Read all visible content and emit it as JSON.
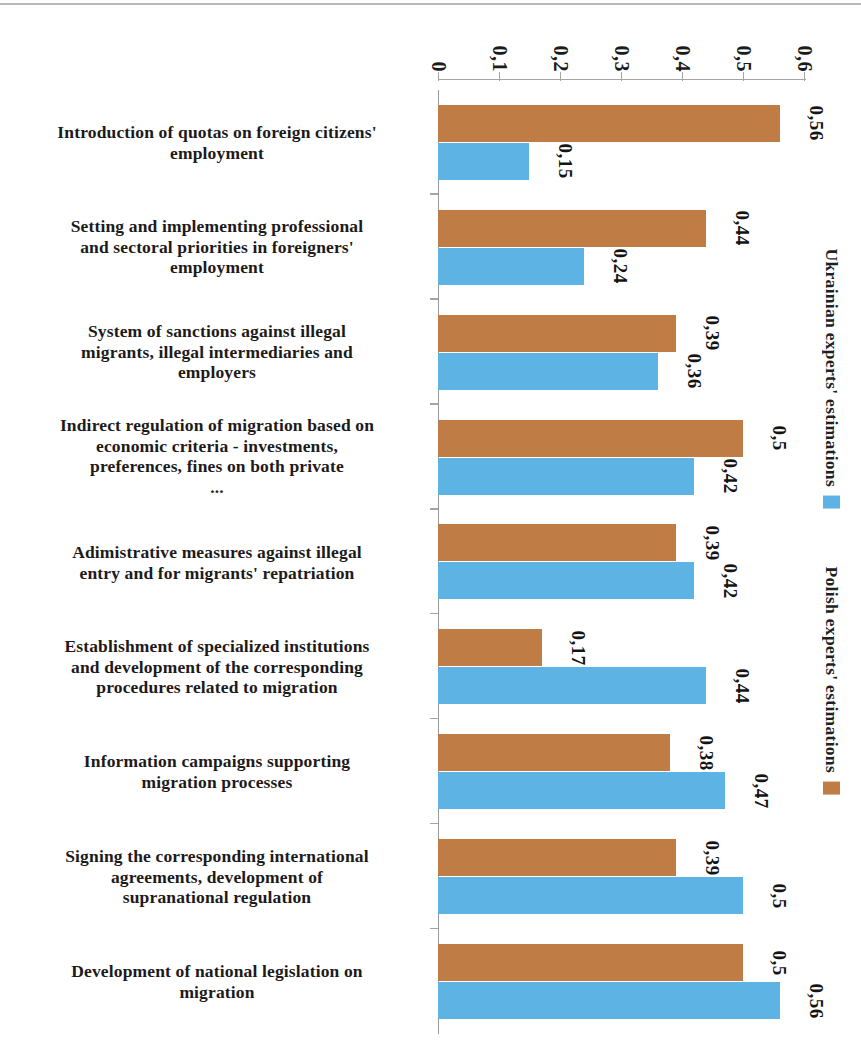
{
  "chart_data": {
    "type": "bar",
    "orientation": "horizontal",
    "title": "",
    "subtitle": "",
    "xlabel": "",
    "ylabel": "",
    "xlim": [
      0,
      0.6
    ],
    "grid": false,
    "legend_position": "left",
    "decimal_separator": ",",
    "axis_ticks": [
      "0",
      "0,1",
      "0,2",
      "0,3",
      "0,4",
      "0,5",
      "0,6"
    ],
    "axis_tick_values": [
      0,
      0.1,
      0.2,
      0.3,
      0.4,
      0.5,
      0.6
    ],
    "categories": [
      "Development of national legislation on migration",
      "Signing the corresponding international agreements, development of supranational regulation",
      "Information campaigns supporting migration processes",
      "Establishment of specialized institutions and development of the corresponding procedures related to migration",
      "Adimistrative measures against illegal entry and for migrants' repatriation",
      "Indirect regulation of migration based on economic criteria - investments, preferences, fines on both private ...",
      "System of sanctions against illegal migrants, illegal intermediaries and employers",
      "Setting and implementing professional and sectoral priorities in foreigners' employment",
      "Introduction of quotas on foreign citizens' employment"
    ],
    "category_lines": [
      [
        "Development of national legislation on",
        "migration"
      ],
      [
        "Signing the corresponding international",
        "agreements, development of",
        "supranational regulation"
      ],
      [
        "Information campaigns supporting",
        "migration processes"
      ],
      [
        "Establishment of specialized institutions",
        "and development of the corresponding",
        "procedures related to migration"
      ],
      [
        "Adimistrative measures against illegal",
        "entry and for migrants' repatriation"
      ],
      [
        "Indirect regulation of migration based on",
        "economic criteria - investments,",
        "preferences, fines on both private",
        "..."
      ],
      [
        "System of sanctions against illegal",
        "migrants, illegal intermediaries and",
        "employers"
      ],
      [
        "Setting and implementing professional",
        "and sectoral priorities in foreigners'",
        "employment"
      ],
      [
        "Introduction of quotas on foreign citizens'",
        "employment"
      ]
    ],
    "series": [
      {
        "name": "Ukrainian experts' estimations",
        "color": "#5cb3e4",
        "values": [
          0.56,
          0.5,
          0.47,
          0.44,
          0.42,
          0.42,
          0.36,
          0.24,
          0.15
        ],
        "labels": [
          "0,56",
          "0,5",
          "0,47",
          "0,44",
          "0,42",
          "0,42",
          "0,36",
          "0,24",
          "0,15"
        ]
      },
      {
        "name": "Polish experts' estimations",
        "color": "#c07c45",
        "values": [
          0.5,
          0.39,
          0.38,
          0.17,
          0.39,
          0.5,
          0.39,
          0.44,
          0.56
        ],
        "labels": [
          "0,5",
          "0,39",
          "0,38",
          "0,17",
          "0,39",
          "0,5",
          "0,39",
          "0,44",
          "0,56"
        ]
      }
    ]
  },
  "legend": {
    "entries": [
      {
        "label": "Ukrainian experts' estimations",
        "color": "#5cb3e4"
      },
      {
        "label": "Polish experts' estimations",
        "color": "#c07c45"
      }
    ]
  }
}
